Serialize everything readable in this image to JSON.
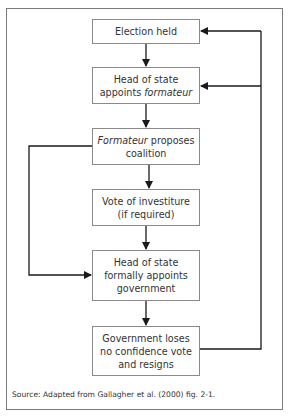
{
  "diagram": {
    "type": "flowchart",
    "nodes": [
      {
        "id": "n1",
        "lines": [
          {
            "text": "Election held"
          }
        ]
      },
      {
        "id": "n2",
        "line1": "Head of state",
        "line2_plain": "appoints ",
        "line2_italic": "formateur"
      },
      {
        "id": "n3",
        "line1_italic": "Formateur",
        "line1_plain": " proposes",
        "line2": "coalition"
      },
      {
        "id": "n4",
        "line1": "Vote of investiture",
        "line2": "(if required)"
      },
      {
        "id": "n5",
        "line1": "Head of state",
        "line2": "formally appoints",
        "line3": "government"
      },
      {
        "id": "n6",
        "line1": "Government loses",
        "line2": "no confidence vote",
        "line3": "and resigns"
      }
    ],
    "edges": [
      {
        "from": "n1",
        "to": "n2"
      },
      {
        "from": "n2",
        "to": "n3"
      },
      {
        "from": "n3",
        "to": "n4"
      },
      {
        "from": "n4",
        "to": "n5"
      },
      {
        "from": "n5",
        "to": "n6"
      },
      {
        "from": "n3",
        "to": "n5",
        "route": "left-bypass"
      },
      {
        "from": "n6",
        "to": "n1",
        "route": "right-feedback"
      },
      {
        "from": "n6",
        "to": "n2",
        "route": "right-feedback"
      }
    ],
    "source": "Source:  Adapted from Gallagher et al. (2000) fig. 2-1.",
    "colors": {
      "line": "#1a1a1a",
      "box_border": "#8a8a8a",
      "frame": "#7a7a7a"
    }
  }
}
